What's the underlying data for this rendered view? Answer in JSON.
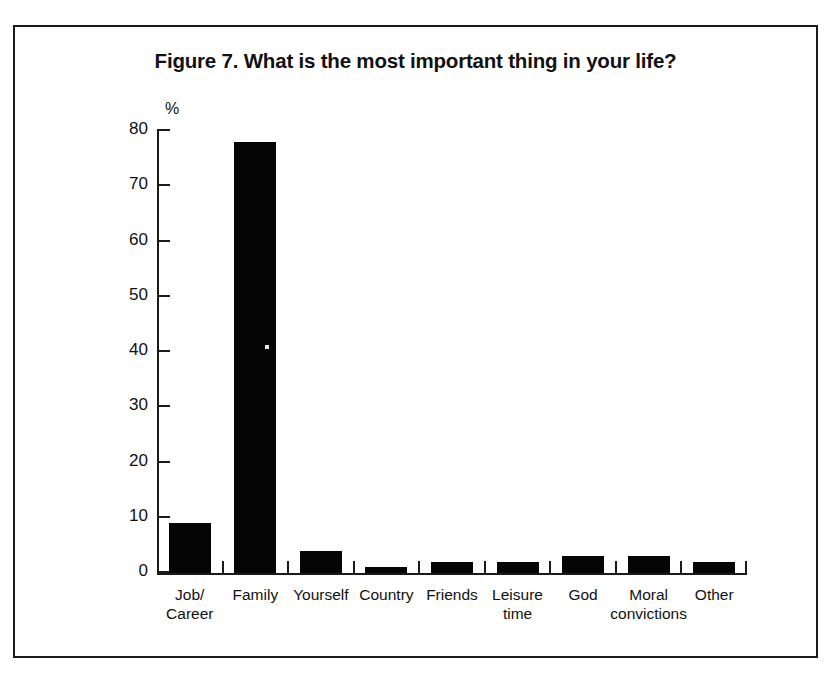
{
  "figure": {
    "title": "Figure 7. What is the most important thing in your life?",
    "border_color": "#1a1a1a",
    "bar_color": "#050505"
  },
  "chart_data": {
    "type": "bar",
    "title": "Figure 7. What is the most important thing in your life?",
    "xlabel": "",
    "ylabel": "%",
    "unit_label": "%",
    "categories": [
      "Job/\nCareer",
      "Family",
      "Yourself",
      "Country",
      "Friends",
      "Leisure\ntime",
      "God",
      "Moral\nconvictions",
      "Other"
    ],
    "values": [
      9,
      78,
      4,
      1,
      2,
      2,
      3,
      3,
      2
    ],
    "ylim": [
      0,
      80
    ],
    "yticks": [
      0,
      10,
      20,
      30,
      40,
      50,
      60,
      70,
      80
    ],
    "ytick_labels": [
      "0",
      "10",
      "20",
      "30",
      "40",
      "50",
      "60",
      "70",
      "80"
    ],
    "grid": false,
    "legend": false
  }
}
